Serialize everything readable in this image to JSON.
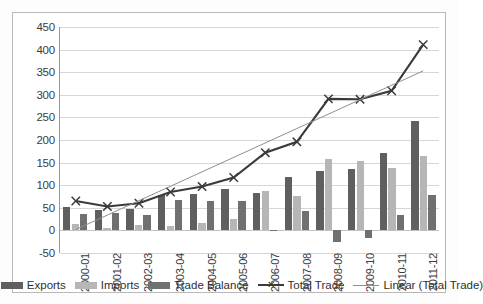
{
  "chart_data": {
    "type": "bar",
    "title": "",
    "subtitle": "",
    "xlabel": "",
    "ylabel": "",
    "ylim": [
      -50,
      450
    ],
    "ytick_step": 50,
    "yticks": [
      450,
      400,
      350,
      300,
      250,
      200,
      150,
      100,
      50,
      0,
      -50
    ],
    "grid": true,
    "legend_position": "bottom",
    "categories": [
      "2000-01",
      "2001-02",
      "2002-03",
      "2003-04",
      "2004-05",
      "2005-06",
      "2006-07",
      "2007-08",
      "2008-09",
      "2009-10",
      "2010-11",
      "2011-12"
    ],
    "series": [
      {
        "name": "Exports",
        "type": "bar",
        "color": "#5f5f5f",
        "values": [
          51,
          45,
          47,
          79,
          81,
          91,
          83,
          119,
          131,
          136,
          172,
          243
        ]
      },
      {
        "name": "Imports",
        "type": "bar",
        "color": "#b6b6b6",
        "values": [
          14,
          6,
          12,
          10,
          16,
          26,
          88,
          77,
          158,
          154,
          137,
          165
        ]
      },
      {
        "name": "Trade Balance",
        "type": "bar",
        "color": "#707070",
        "values": [
          37,
          39,
          35,
          67,
          66,
          64,
          -2,
          43,
          -25,
          -17,
          34,
          78
        ]
      },
      {
        "name": "Total Trade",
        "type": "line",
        "color": "#3a3a3a",
        "marker": "x",
        "values": [
          65,
          53,
          60,
          85,
          97,
          117,
          172,
          196,
          291,
          290,
          309,
          411
        ]
      },
      {
        "name": "Linear (Total Trade)",
        "type": "trendline",
        "color": "#8f8f8f",
        "values": [
          2,
          34,
          66,
          98,
          130,
          162,
          194,
          226,
          258,
          290,
          322,
          353
        ]
      }
    ]
  },
  "legend": {
    "items": [
      {
        "label": "Exports",
        "kind": "swatch",
        "color": "#5f5f5f"
      },
      {
        "label": "Imports",
        "kind": "swatch",
        "color": "#b6b6b6"
      },
      {
        "label": "Trade Balance",
        "kind": "swatch",
        "color": "#707070"
      },
      {
        "label": "Total Trade",
        "kind": "marker-line",
        "color": "#3a3a3a"
      },
      {
        "label": "Linear (Total Trade)",
        "kind": "line",
        "color": "#8f8f8f"
      }
    ]
  }
}
